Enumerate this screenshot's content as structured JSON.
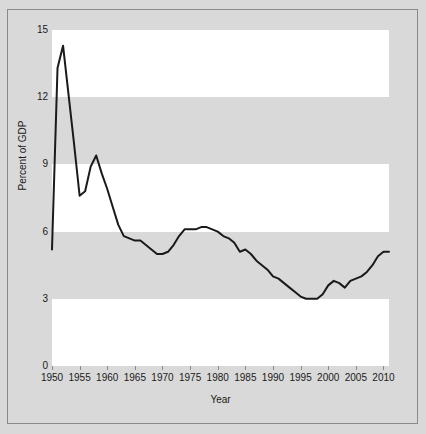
{
  "chart_data": {
    "type": "line",
    "title": "",
    "xlabel": "Year",
    "ylabel": "Percent of GDP",
    "xlim": [
      1950,
      2011
    ],
    "ylim": [
      0,
      15
    ],
    "yticks": [
      0,
      3,
      6,
      9,
      12,
      15
    ],
    "ytick_labels": [
      "0",
      "3",
      "6",
      "9",
      "12",
      "15"
    ],
    "xticks": [
      1950,
      1955,
      1960,
      1965,
      1970,
      1975,
      1980,
      1985,
      1990,
      1995,
      2000,
      2005,
      2010
    ],
    "xtick_labels": [
      "1950",
      "1955",
      "1960",
      "1965",
      "1970",
      "1975",
      "1980",
      "1985",
      "1990",
      "1995",
      "2000",
      "2005",
      "2010"
    ],
    "grid": false,
    "banded_background": true,
    "band_colors": [
      "#ffffff",
      "#d9d9d9"
    ],
    "legend": null,
    "line_color": "#1a1a1a",
    "line_width": 2,
    "series": [
      {
        "name": "Percent of GDP",
        "x": [
          1950,
          1951,
          1952,
          1953,
          1954,
          1955,
          1956,
          1957,
          1958,
          1959,
          1960,
          1961,
          1962,
          1963,
          1964,
          1965,
          1966,
          1967,
          1968,
          1969,
          1970,
          1971,
          1972,
          1973,
          1974,
          1975,
          1976,
          1977,
          1978,
          1979,
          1980,
          1981,
          1982,
          1983,
          1984,
          1985,
          1986,
          1987,
          1988,
          1989,
          1990,
          1991,
          1992,
          1993,
          1994,
          1995,
          1996,
          1997,
          1998,
          1999,
          2000,
          2001,
          2002,
          2003,
          2004,
          2005,
          2006,
          2007,
          2008,
          2009,
          2010,
          2011
        ],
        "y": [
          5.2,
          13.3,
          14.3,
          12.1,
          9.9,
          7.6,
          7.8,
          8.9,
          9.4,
          8.6,
          7.9,
          7.1,
          6.3,
          5.8,
          5.7,
          5.6,
          5.6,
          5.4,
          5.2,
          5.0,
          5.0,
          5.1,
          5.4,
          5.8,
          6.1,
          6.1,
          6.1,
          6.2,
          6.2,
          6.1,
          6.0,
          5.8,
          5.7,
          5.5,
          5.1,
          5.2,
          5.0,
          4.7,
          4.5,
          4.3,
          4.0,
          3.9,
          3.7,
          3.5,
          3.3,
          3.1,
          3.0,
          3.0,
          3.0,
          3.2,
          3.6,
          3.8,
          3.7,
          3.5,
          3.8,
          3.9,
          4.0,
          4.2,
          4.5,
          4.9,
          5.1,
          5.1
        ]
      }
    ]
  },
  "axes": {
    "x_title": "Year",
    "y_title": "Percent of GDP"
  }
}
